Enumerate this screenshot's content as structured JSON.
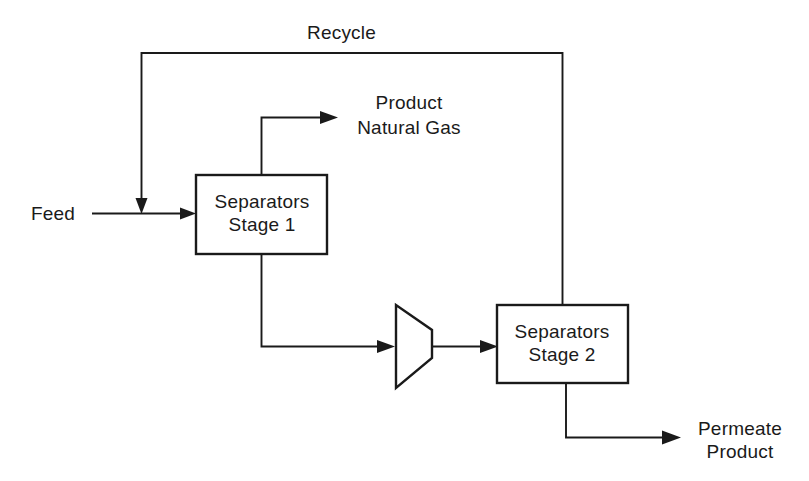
{
  "diagram": {
    "background_color": "#ffffff",
    "line_color": "#1a1a1a",
    "units": [
      {
        "id": "stage1",
        "line1": "Separators",
        "line2": "Stage 1"
      },
      {
        "id": "stage2",
        "line1": "Separators",
        "line2": "Stage 2"
      },
      {
        "id": "compressor",
        "shape": "compressor-trapezoid",
        "label": ""
      }
    ],
    "streams": [
      {
        "id": "feed",
        "label": "Feed",
        "from": "inlet",
        "to": "stage1"
      },
      {
        "id": "recycle",
        "label": "Recycle",
        "from": "stage2",
        "to": "feed"
      },
      {
        "id": "product_gas",
        "line1": "Product",
        "line2": "Natural Gas",
        "from": "stage1",
        "to": "outlet"
      },
      {
        "id": "permeate",
        "line1": "Permeate",
        "line2": "Product",
        "from": "stage2",
        "to": "outlet"
      },
      {
        "id": "stage1_retentate",
        "label": "",
        "from": "stage1",
        "to": "compressor"
      },
      {
        "id": "compressor_discharge",
        "label": "",
        "from": "compressor",
        "to": "stage2"
      }
    ]
  }
}
